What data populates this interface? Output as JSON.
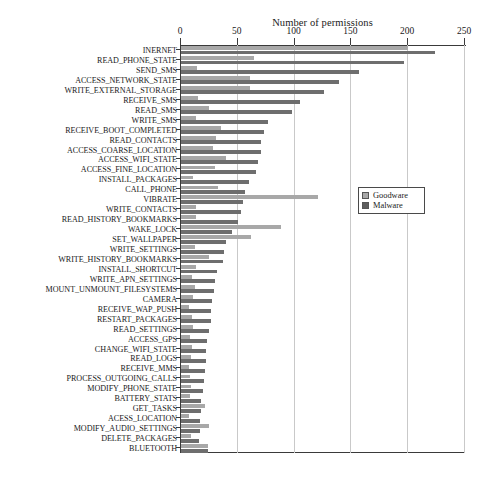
{
  "chart": {
    "title": "Number of permissions",
    "legend": {
      "position": "right-middle",
      "entries": [
        {
          "label": "Goodware",
          "color": "#a8a8a8",
          "icon": "legend-swatch-goodware"
        },
        {
          "label": "Malware",
          "color": "#5d5d5d",
          "icon": "legend-swatch-malware"
        }
      ]
    },
    "xaxis": {
      "ticks": [
        "0",
        "50",
        "100",
        "150",
        "200",
        "250"
      ],
      "min": 0,
      "max": 250,
      "grid": true,
      "label": ""
    },
    "yaxis": {
      "label": ""
    }
  },
  "chart_data": {
    "type": "bar",
    "orientation": "horizontal",
    "title": "Number of permissions",
    "xlabel": "Number of permissions",
    "ylabel": "",
    "xlim": [
      0,
      250
    ],
    "grid": true,
    "legend_position": "right",
    "categories": [
      "INERNET",
      "READ_PHONE_STATE",
      "SEND_SMS",
      "ACCESS_NETWORK_STATE",
      "WRITE_EXTERNAL_STORAGE",
      "RECEIVE_SMS",
      "READ_SMS",
      "WRITE_SMS",
      "RECEIVE_BOOT_COMPLETED",
      "READ_CONTACTS",
      "ACCESS_COARSE_LOCATION",
      "ACCESS_WIFI_STATE",
      "ACCESS_FINE_LOCATION",
      "INSTALL_PACKAGES",
      "CALL_PHONE",
      "VIBRATE",
      "WRITE_CONTACTS",
      "READ_HISTORY_BOOKMARKS",
      "WAKE_LOCK",
      "SET_WALLPAPER",
      "WRITE_SETTINGS",
      "WRITE_HISTORY_BOOKMARKS",
      "INSTALL_SHORTCUT",
      "WRITE_APN_SETTINGS",
      "MOUNT_UNMOUNT_FILESYSTEMS",
      "CAMERA",
      "RECEIVE_WAP_PUSH",
      "RESTART_PACKAGES",
      "READ_SETTINGS",
      "ACCESS_GPS",
      "CHANGE_WIFI_STATE",
      "READ_LOGS",
      "RECEIVE_MMS",
      "PROCESS_OUTGOING_CALLS",
      "MODIFY_PHONE_STATE",
      "BATTERY_STATS",
      "GET_TASKS",
      "ACESS_LOCATION",
      "MODIFY_AUDIO_SETTINGS",
      "DELETE_PACKAGES",
      "BLUETOOTH"
    ],
    "series": [
      {
        "name": "Goodware",
        "color": "#a8a8a8",
        "values": [
          200,
          64,
          14,
          61,
          61,
          15,
          25,
          13,
          35,
          31,
          28,
          40,
          30,
          11,
          33,
          121,
          13,
          13,
          88,
          62,
          12,
          25,
          13,
          10,
          12,
          11,
          7,
          10,
          11,
          8,
          10,
          9,
          7,
          8,
          9,
          8,
          21,
          7,
          25,
          9,
          24
        ]
      },
      {
        "name": "Malware",
        "color": "#6e6e6e",
        "values": [
          224,
          196,
          157,
          139,
          126,
          105,
          98,
          77,
          73,
          70,
          70,
          68,
          66,
          60,
          56,
          55,
          53,
          50,
          45,
          40,
          38,
          37,
          32,
          30,
          29,
          27,
          26,
          26,
          25,
          23,
          22,
          22,
          21,
          20,
          19,
          18,
          18,
          17,
          17,
          16,
          24
        ]
      }
    ]
  }
}
